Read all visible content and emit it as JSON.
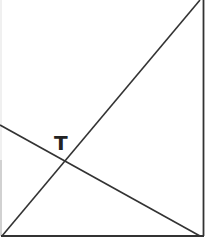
{
  "diagram": {
    "type": "geometry",
    "colors": {
      "background": "#ffffff",
      "stroke": "#333333",
      "faint_stroke": "#e6e6e6",
      "label": "#222222"
    },
    "labels": [
      {
        "text": "T",
        "x": 54,
        "y": 133
      }
    ],
    "segments": [
      {
        "name": "right-edge",
        "x1": 203,
        "y1": 0,
        "x2": 203,
        "y2": 236
      },
      {
        "name": "bottom-edge",
        "x1": 2,
        "y1": 236,
        "x2": 203,
        "y2": 236
      },
      {
        "name": "left-edge",
        "x1": 1,
        "y1": 0,
        "x2": 1,
        "y2": 236
      },
      {
        "name": "diagonal-rising",
        "x1": 2,
        "y1": 236,
        "x2": 200,
        "y2": 0
      },
      {
        "name": "diagonal-falling",
        "x1": 0,
        "y1": 125,
        "x2": 200,
        "y2": 236
      }
    ],
    "intersection_point": {
      "label": "T",
      "x": 65,
      "y": 161
    }
  }
}
